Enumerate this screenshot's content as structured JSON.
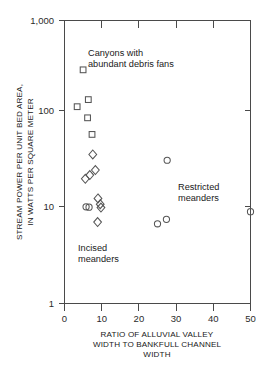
{
  "chart_data": {
    "type": "scatter",
    "title": "",
    "xlabel": "RATIO OF ALLUVIAL VALLEY WIDTH TO BANKFULL CHANNEL WIDTH",
    "ylabel": "STREAM POWER PER UNIT BED AREA, IN WATTS PER SQUARE METER",
    "xlim": [
      0,
      50
    ],
    "ylim": [
      1,
      1000
    ],
    "yscale": "log",
    "xscale": "linear",
    "grid": false,
    "legend_position": "none",
    "xticks": [
      "0",
      "10",
      "20",
      "30",
      "40",
      "50"
    ],
    "xtick_values": [
      0,
      10,
      20,
      30,
      40,
      50
    ],
    "yticks": [
      "1",
      "10",
      "100",
      "1,000"
    ],
    "ytick_values": [
      1,
      10,
      100,
      1000
    ],
    "series": [
      {
        "name": "Canyons with abundant debris fans",
        "marker": "square",
        "points": [
          {
            "x": 5.0,
            "y": 300
          },
          {
            "x": 3.4,
            "y": 122
          },
          {
            "x": 6.4,
            "y": 145
          },
          {
            "x": 6.2,
            "y": 93
          },
          {
            "x": 7.4,
            "y": 62
          }
        ]
      },
      {
        "name": "Incised meanders",
        "marker": "diamond",
        "points": [
          {
            "x": 7.6,
            "y": 38
          },
          {
            "x": 8.3,
            "y": 26
          },
          {
            "x": 6.8,
            "y": 23
          },
          {
            "x": 5.6,
            "y": 21
          },
          {
            "x": 9.0,
            "y": 13
          },
          {
            "x": 9.6,
            "y": 11.3
          },
          {
            "x": 9.8,
            "y": 10.4
          },
          {
            "x": 8.9,
            "y": 7.3
          }
        ]
      },
      {
        "name": "Restricted meanders",
        "marker": "circle",
        "points": [
          {
            "x": 5.8,
            "y": 10.6
          },
          {
            "x": 6.6,
            "y": 10.5
          },
          {
            "x": 27.6,
            "y": 33
          },
          {
            "x": 25.0,
            "y": 7.0
          },
          {
            "x": 27.4,
            "y": 7.8
          },
          {
            "x": 50.0,
            "y": 9.4
          }
        ]
      }
    ],
    "annotations": [
      {
        "name": "canyons-label",
        "lines": [
          "Canyons with",
          "abundant debris fans"
        ],
        "x_px": 88,
        "y_px": 55
      },
      {
        "name": "restricted-label",
        "lines": [
          "Restricted",
          "meanders"
        ],
        "x_px": 178,
        "y_px": 190
      },
      {
        "name": "incised-label",
        "lines": [
          "Incised",
          "meanders"
        ],
        "x_px": 78,
        "y_px": 250
      }
    ]
  },
  "axis": {
    "y_title_line1": "STREAM POWER PER UNIT BED AREA,",
    "y_title_line2": "IN WATTS PER SQUARE METER",
    "x_title_line1": "RATIO OF ALLUVIAL VALLEY",
    "x_title_line2": "WIDTH TO BANKFULL CHANNEL",
    "x_title_line3": "WIDTH"
  },
  "ticklabels": {
    "y": {
      "t1000": "1,000",
      "t100": "100",
      "t10": "10",
      "t1": "1"
    },
    "x": {
      "t0": "0",
      "t10": "10",
      "t20": "20",
      "t30": "30",
      "t40": "40",
      "t50": "50"
    }
  },
  "annotations_text": {
    "canyons_line1": "Canyons with",
    "canyons_line2": "abundant debris fans",
    "restricted_line1": "Restricted",
    "restricted_line2": "meanders",
    "incised_line1": "Incised",
    "incised_line2": "meanders"
  },
  "colors": {
    "axis": "#4a4a4a",
    "marker_stroke": "#555555",
    "text": "#202020",
    "background": "#ffffff"
  }
}
